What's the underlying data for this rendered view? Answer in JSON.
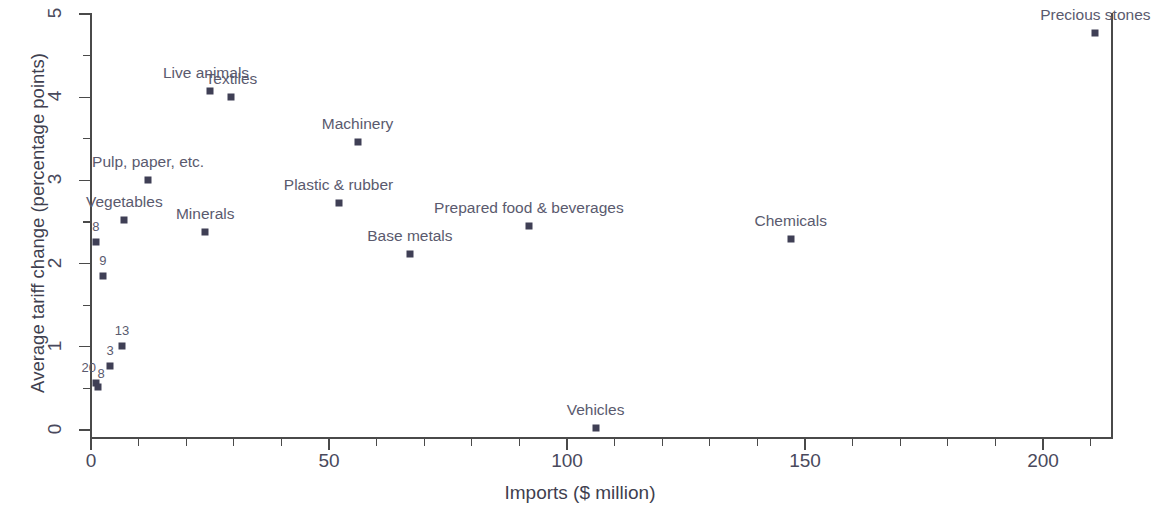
{
  "chart_data": {
    "type": "scatter",
    "title": "",
    "xlabel": "Imports ($ million)",
    "ylabel": "Average tariff change (percentage points)",
    "xlim": [
      -3,
      218
    ],
    "ylim": [
      -0.16,
      5.1
    ],
    "xticks": [
      0,
      50,
      100,
      150,
      200
    ],
    "xticklabels": [
      "0",
      "50",
      "100",
      "150",
      "200"
    ],
    "x_minor_tick_interval": 10,
    "yticks": [
      0,
      1,
      2,
      3,
      4,
      5
    ],
    "yticklabels": [
      "0",
      "1",
      "2",
      "3",
      "4",
      "5"
    ],
    "y_minor_tick_interval": 0.5,
    "grid": false,
    "legend": "none",
    "marker_color": "#3f3f55",
    "label_color": "#5a5a6e",
    "axis_color": "#4a4a4a",
    "points": [
      {
        "label": "Precious stones",
        "x": 211,
        "y": 4.77,
        "label_dx": 0,
        "label_dy": -9,
        "small": false
      },
      {
        "label": "Live animals",
        "x": 25,
        "y": 4.08,
        "label_dx": -4,
        "label_dy": -9,
        "small": false
      },
      {
        "label": "Textiles",
        "x": 29.5,
        "y": 4.0,
        "label_dx": 0,
        "label_dy": -9,
        "small": false
      },
      {
        "label": "Machinery",
        "x": 56,
        "y": 3.46,
        "label_dx": 0,
        "label_dy": -9,
        "small": false
      },
      {
        "label": "Pulp, paper, etc.",
        "x": 12,
        "y": 3.0,
        "label_dx": 0,
        "label_dy": -9,
        "small": false
      },
      {
        "label": "Plastic & rubber",
        "x": 52,
        "y": 2.73,
        "label_dx": 0,
        "label_dy": -9,
        "small": false
      },
      {
        "label": "Vegetables",
        "x": 7,
        "y": 2.52,
        "label_dx": 0,
        "label_dy": -9,
        "small": false
      },
      {
        "label": "Prepared food & beverages",
        "x": 92,
        "y": 2.45,
        "label_dx": 0,
        "label_dy": -9,
        "small": false
      },
      {
        "label": "Minerals",
        "x": 24,
        "y": 2.38,
        "label_dx": 0,
        "label_dy": -9,
        "small": false
      },
      {
        "label": "Chemicals",
        "x": 147,
        "y": 2.29,
        "label_dx": 0,
        "label_dy": -9,
        "small": false
      },
      {
        "label": "Base metals",
        "x": 67,
        "y": 2.12,
        "label_dx": 0,
        "label_dy": -9,
        "small": false
      },
      {
        "label": "8",
        "x": 1,
        "y": 2.26,
        "label_dx": 0,
        "label_dy": -8,
        "small": true
      },
      {
        "label": "9",
        "x": 2.5,
        "y": 1.85,
        "label_dx": 0,
        "label_dy": -8,
        "small": true
      },
      {
        "label": "13",
        "x": 6.5,
        "y": 1.01,
        "label_dx": 0,
        "label_dy": -8,
        "small": true
      },
      {
        "label": "3",
        "x": 4,
        "y": 0.77,
        "label_dx": 0,
        "label_dy": -8,
        "small": true
      },
      {
        "label": "20",
        "x": 1,
        "y": 0.56,
        "label_dx": -7,
        "label_dy": -8,
        "small": true
      },
      {
        "label": "8",
        "x": 1.5,
        "y": 0.52,
        "label_dx": 3,
        "label_dy": -6,
        "small": true
      },
      {
        "label": "Vehicles",
        "x": 106,
        "y": 0.02,
        "label_dx": 0,
        "label_dy": -9,
        "small": false
      }
    ]
  },
  "axes": {
    "x_title": "Imports ($ million)",
    "y_title": "Average tariff change (percentage points)"
  }
}
